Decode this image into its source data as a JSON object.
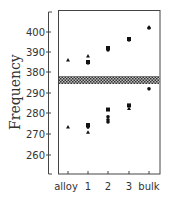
{
  "chart_data": {
    "type": "scatter",
    "title": "",
    "xlabel": "",
    "ylabel": "Frequency",
    "categories": [
      "alloy",
      "1",
      "2",
      "3",
      "bulk"
    ],
    "axis_break": {
      "between": [
        290,
        380
      ],
      "style": "hatched band"
    },
    "upper_panel": {
      "yticks": [
        380,
        390,
        400
      ],
      "points": [
        {
          "category": "alloy",
          "marker": "triangle",
          "value": 386
        },
        {
          "category": "1",
          "marker": "triangle",
          "value": 388
        },
        {
          "category": "1",
          "marker": "square",
          "value": 385
        },
        {
          "category": "1",
          "marker": "circle",
          "value": 384.5
        },
        {
          "category": "2",
          "marker": "square",
          "value": 392
        },
        {
          "category": "2",
          "marker": "circle",
          "value": 391
        },
        {
          "category": "3",
          "marker": "square",
          "value": 396.5
        },
        {
          "category": "3",
          "marker": "circle",
          "value": 396
        },
        {
          "category": "bulk",
          "marker": "triangle",
          "value": 402.5
        },
        {
          "category": "bulk",
          "marker": "circle",
          "value": 402
        }
      ]
    },
    "lower_panel": {
      "yticks": [
        260,
        270,
        280,
        290
      ],
      "points": [
        {
          "category": "alloy",
          "marker": "triangle",
          "value": 273.5
        },
        {
          "category": "1",
          "marker": "square",
          "value": 274.5
        },
        {
          "category": "1",
          "marker": "circle",
          "value": 273.5
        },
        {
          "category": "1",
          "marker": "triangle",
          "value": 271
        },
        {
          "category": "2",
          "marker": "square",
          "value": 282
        },
        {
          "category": "2",
          "marker": "circle",
          "value": 278.5
        },
        {
          "category": "2",
          "marker": "circle",
          "value": 277
        },
        {
          "category": "2",
          "marker": "circle",
          "value": 276
        },
        {
          "category": "3",
          "marker": "square",
          "value": 284
        },
        {
          "category": "3",
          "marker": "triangle",
          "value": 282.5
        },
        {
          "category": "bulk",
          "marker": "circle",
          "value": 292
        }
      ]
    },
    "ytick_labels": [
      "400",
      "390",
      "380",
      "290",
      "280",
      "270",
      "260"
    ],
    "grid": false,
    "legend": null
  }
}
